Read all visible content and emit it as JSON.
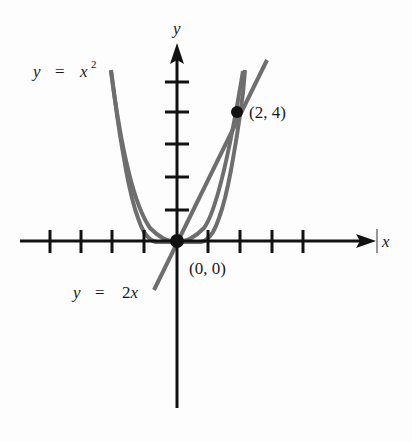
{
  "figure": {
    "colors": {
      "axis": "#111111",
      "curve": "#6e6e6e",
      "point": "#111111",
      "text": "#1a1a1a",
      "background": "#fdfdfd"
    },
    "axes": {
      "x_label": "x",
      "y_label": "y",
      "x_ticks": [
        -4,
        -3,
        -2,
        -1,
        1,
        2,
        3,
        4
      ],
      "y_ticks": [
        1,
        2,
        3,
        4,
        5
      ]
    },
    "curves": [
      {
        "name": "parabola",
        "label_lhs": "y",
        "label_eq": "=",
        "label_rhs": "x",
        "label_exp": "2"
      },
      {
        "name": "line",
        "label_lhs": "y",
        "label_eq": "=",
        "label_rhs": "2x"
      }
    ],
    "points": [
      {
        "name": "origin",
        "label": "(0, 0)",
        "x": 0,
        "y": 0
      },
      {
        "name": "intersection",
        "label": "(2, 4)",
        "x": 2,
        "y": 4
      }
    ]
  }
}
